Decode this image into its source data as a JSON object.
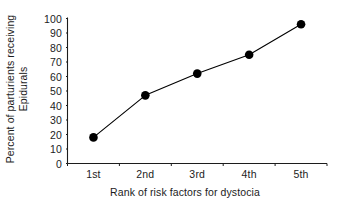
{
  "chart_data": {
    "type": "line",
    "title": "",
    "subtitle": "",
    "xlabel": "Rank of risk factors for dystocia",
    "ylabel": "Percent of parturients receiving Epidurals",
    "ylabel_lines": [
      "Percent of parturients receiving",
      "Epidurals"
    ],
    "categories": [
      "1st",
      "2nd",
      "3rd",
      "4th",
      "5th"
    ],
    "values": [
      18,
      47,
      62,
      75,
      96
    ],
    "series": [
      {
        "name": "Percent receiving epidurals",
        "values": [
          18,
          47,
          62,
          75,
          96
        ]
      }
    ],
    "ylim": [
      0,
      100
    ],
    "ytick_values": [
      0,
      10,
      20,
      30,
      40,
      50,
      60,
      70,
      80,
      90,
      100
    ],
    "ytick_labels": [
      "0",
      "10",
      "20",
      "30",
      "40",
      "50",
      "60",
      "70",
      "80",
      "90",
      "100"
    ],
    "grid": false,
    "legend": false,
    "legend_position": "none",
    "marker": "filled-circle",
    "line_color": "#000000",
    "marker_color": "#000000",
    "axis_color": "#1c1c1c",
    "background_color": "#ffffff",
    "annotations": []
  }
}
